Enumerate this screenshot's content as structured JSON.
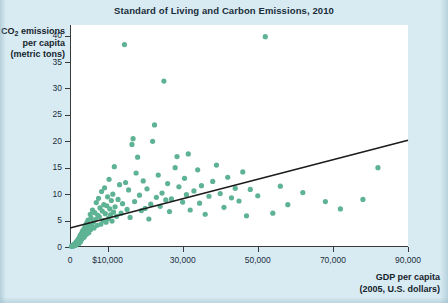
{
  "chart_data": {
    "type": "scatter",
    "title": "Standard of Living and Carbon Emissions, 2010",
    "xlabel_line1": "GDP per capita",
    "xlabel_line2": "(2005, U.S. dollars)",
    "ylabel_line1_pre": "CO",
    "ylabel_line1_sub": "2",
    "ylabel_line1_post": " emissions",
    "ylabel_line2": "per capita",
    "ylabel_line3": "(metric tons)",
    "xlim": [
      0,
      90000
    ],
    "ylim": [
      0,
      42
    ],
    "grid": false,
    "legend": null,
    "xticks": [
      0,
      10000,
      30000,
      50000,
      70000,
      90000
    ],
    "xtick_labels": [
      "0",
      "$10,000",
      "30,000",
      "50,000",
      "70,000",
      "90,000"
    ],
    "yticks": [
      0,
      5,
      10,
      15,
      20,
      25,
      30,
      35,
      40
    ],
    "ytick_labels": [
      "0",
      "5",
      "10",
      "15",
      "20",
      "25",
      "30",
      "35",
      "40"
    ],
    "marker_color": "#5fb395",
    "marker_size": 2.6,
    "trendline": {
      "color": "#1c1c1c",
      "width": 1.6,
      "x0": 0,
      "y0": 3.6,
      "x1": 90000,
      "y1": 20.2
    },
    "points": [
      [
        400,
        0.1
      ],
      [
        550,
        0.2
      ],
      [
        700,
        0.3
      ],
      [
        800,
        0.15
      ],
      [
        900,
        0.4
      ],
      [
        1000,
        0.25
      ],
      [
        1100,
        0.5
      ],
      [
        1200,
        0.35
      ],
      [
        1300,
        0.6
      ],
      [
        1400,
        0.3
      ],
      [
        1500,
        0.8
      ],
      [
        1600,
        0.45
      ],
      [
        1700,
        1.0
      ],
      [
        1800,
        0.55
      ],
      [
        1900,
        0.7
      ],
      [
        2000,
        1.2
      ],
      [
        2100,
        0.9
      ],
      [
        2200,
        1.5
      ],
      [
        2300,
        1.1
      ],
      [
        2400,
        0.65
      ],
      [
        2500,
        1.8
      ],
      [
        2600,
        1.3
      ],
      [
        2700,
        2.2
      ],
      [
        2800,
        1.0
      ],
      [
        2900,
        1.6
      ],
      [
        3000,
        2.5
      ],
      [
        3100,
        1.4
      ],
      [
        3200,
        2.0
      ],
      [
        3300,
        3.0
      ],
      [
        3400,
        1.7
      ],
      [
        3500,
        2.8
      ],
      [
        3600,
        2.1
      ],
      [
        3700,
        3.4
      ],
      [
        3800,
        1.9
      ],
      [
        3900,
        2.6
      ],
      [
        4000,
        3.8
      ],
      [
        4100,
        2.3
      ],
      [
        4200,
        4.2
      ],
      [
        4300,
        3.1
      ],
      [
        4400,
        2.4
      ],
      [
        4500,
        4.6
      ],
      [
        4600,
        3.5
      ],
      [
        4700,
        2.9
      ],
      [
        4800,
        5.1
      ],
      [
        4900,
        3.9
      ],
      [
        5000,
        2.7
      ],
      [
        5200,
        4.4
      ],
      [
        5400,
        6.2
      ],
      [
        5500,
        3.3
      ],
      [
        5600,
        5.5
      ],
      [
        5800,
        4.0
      ],
      [
        6000,
        7.0
      ],
      [
        6200,
        4.8
      ],
      [
        6400,
        3.6
      ],
      [
        6600,
        6.5
      ],
      [
        6800,
        5.2
      ],
      [
        7000,
        8.4
      ],
      [
        7200,
        4.1
      ],
      [
        7400,
        6.0
      ],
      [
        7600,
        9.2
      ],
      [
        7800,
        5.7
      ],
      [
        8000,
        7.4
      ],
      [
        8200,
        4.3
      ],
      [
        8400,
        10.5
      ],
      [
        8600,
        6.8
      ],
      [
        8800,
        5.0
      ],
      [
        9000,
        8.0
      ],
      [
        9200,
        11.2
      ],
      [
        9400,
        6.3
      ],
      [
        9600,
        4.7
      ],
      [
        9800,
        7.8
      ],
      [
        10000,
        9.5
      ],
      [
        10200,
        5.4
      ],
      [
        10400,
        12.8
      ],
      [
        10600,
        7.2
      ],
      [
        10800,
        6.1
      ],
      [
        11000,
        8.8
      ],
      [
        11200,
        4.9
      ],
      [
        11400,
        10.0
      ],
      [
        11600,
        6.6
      ],
      [
        11800,
        15.2
      ],
      [
        12000,
        7.6
      ],
      [
        12400,
        5.8
      ],
      [
        12800,
        9.0
      ],
      [
        13200,
        11.8
      ],
      [
        13600,
        6.4
      ],
      [
        14000,
        8.2
      ],
      [
        14500,
        38.3
      ],
      [
        14800,
        12.2
      ],
      [
        15200,
        7.1
      ],
      [
        15600,
        10.8
      ],
      [
        16000,
        5.6
      ],
      [
        16500,
        19.4
      ],
      [
        16800,
        20.5
      ],
      [
        17200,
        8.6
      ],
      [
        17600,
        14.0
      ],
      [
        18000,
        17.0
      ],
      [
        18500,
        9.8
      ],
      [
        19000,
        6.9
      ],
      [
        19500,
        12.5
      ],
      [
        20000,
        7.3
      ],
      [
        20500,
        11.0
      ],
      [
        21000,
        5.3
      ],
      [
        21500,
        8.1
      ],
      [
        22000,
        20.0
      ],
      [
        22500,
        23.1
      ],
      [
        23000,
        9.4
      ],
      [
        23500,
        13.6
      ],
      [
        24000,
        7.7
      ],
      [
        24500,
        10.2
      ],
      [
        25000,
        31.4
      ],
      [
        25500,
        8.9
      ],
      [
        26000,
        12.0
      ],
      [
        26500,
        6.7
      ],
      [
        27000,
        9.1
      ],
      [
        28000,
        15.0
      ],
      [
        28500,
        17.1
      ],
      [
        29000,
        11.4
      ],
      [
        30000,
        8.5
      ],
      [
        30500,
        13.0
      ],
      [
        31000,
        9.9
      ],
      [
        31500,
        17.6
      ],
      [
        32000,
        7.0
      ],
      [
        33000,
        10.6
      ],
      [
        34000,
        14.6
      ],
      [
        34500,
        8.3
      ],
      [
        35000,
        11.6
      ],
      [
        36000,
        6.2
      ],
      [
        37000,
        9.6
      ],
      [
        38000,
        12.4
      ],
      [
        39000,
        15.5
      ],
      [
        40000,
        10.1
      ],
      [
        41000,
        7.5
      ],
      [
        42000,
        13.2
      ],
      [
        43000,
        9.3
      ],
      [
        44000,
        11.1
      ],
      [
        45000,
        8.7
      ],
      [
        46000,
        14.2
      ],
      [
        47000,
        5.9
      ],
      [
        48000,
        10.9
      ],
      [
        50000,
        9.7
      ],
      [
        52000,
        39.8
      ],
      [
        54000,
        6.4
      ],
      [
        56000,
        11.5
      ],
      [
        58000,
        8.0
      ],
      [
        62000,
        10.3
      ],
      [
        68000,
        8.6
      ],
      [
        72000,
        7.2
      ],
      [
        78000,
        9.0
      ],
      [
        82000,
        15.0
      ]
    ]
  }
}
